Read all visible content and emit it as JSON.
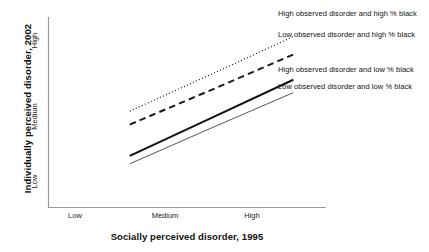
{
  "chart_data": {
    "type": "line",
    "title": "",
    "xlabel": "Socially perceived disorder, 1995",
    "ylabel": "Individually perceived disorder, 2002",
    "x_tick_labels": [
      "Low",
      "Medium",
      "High"
    ],
    "y_tick_labels": [
      "Low",
      "Medium",
      "High"
    ],
    "x": [
      1,
      2,
      3
    ],
    "xlim": [
      0,
      3.4
    ],
    "ylim": [
      0,
      3.4
    ],
    "grid": false,
    "legend_position": "right-inline-at-line-ends",
    "series": [
      {
        "name": "High observed disorder and high % black",
        "style": "dotted",
        "color": "#1a1a1a",
        "width": 1.1,
        "values": [
          1.72,
          2.38,
          3.05
        ]
      },
      {
        "name": "Low observed disorder and high % black",
        "style": "dashed",
        "color": "#1a1a1a",
        "width": 2.0,
        "values": [
          1.48,
          2.1,
          2.73
        ]
      },
      {
        "name": "High observed disorder and low % black",
        "style": "solid-thick",
        "color": "#111111",
        "width": 2.0,
        "values": [
          0.92,
          1.6,
          2.28
        ]
      },
      {
        "name": "Low observed disorder and low % black",
        "style": "solid-thin",
        "color": "#555555",
        "width": 1.0,
        "values": [
          0.78,
          1.42,
          2.05
        ]
      }
    ]
  },
  "axes": {
    "y_ticks": [
      {
        "label": "High"
      },
      {
        "label": "Medium"
      },
      {
        "label": "Low"
      }
    ],
    "x_ticks": [
      {
        "label": "Low"
      },
      {
        "label": "Medium"
      },
      {
        "label": "High"
      }
    ],
    "axis_color": "#999999"
  },
  "legend": {
    "items": [
      {
        "label": "High observed disorder and high % black"
      },
      {
        "label": "Low observed disorder and high % black"
      },
      {
        "label": "High observed disorder and low % black"
      },
      {
        "label": "Low observed disorder and low % black"
      }
    ]
  }
}
